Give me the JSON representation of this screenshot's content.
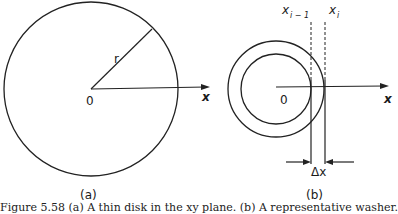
{
  "figure_a": {
    "label": "(a)",
    "radius_label": "r",
    "origin_label": "0",
    "axis_label": "x"
  },
  "figure_b": {
    "label": "(b)",
    "origin_label": "0",
    "axis_label": "x",
    "x_prev_label": "x",
    "x_prev_sub": "i − 1",
    "x_curr_label": "x",
    "x_curr_sub": "i",
    "delta_label": "Δx"
  },
  "caption": "Figure 5.58 (a) A thin disk in the xy plane. (b) A representative washer."
}
